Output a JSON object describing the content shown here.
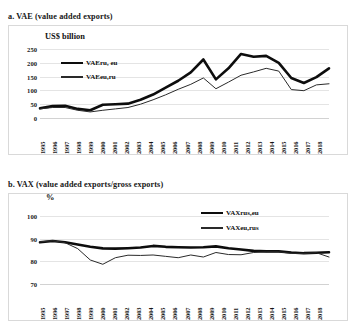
{
  "figure": {
    "panels": [
      {
        "caption": "a. VAE (value added exports)",
        "unit_label": "US$ billion"
      },
      {
        "caption": "b. VAX (value added exports/gross exports)",
        "unit_label": "%"
      }
    ]
  },
  "colors": {
    "series_thick": "#0d0d0d",
    "series_thin": "#2a2a2a",
    "grid": "#e4e4e4",
    "frame": "#d9d9d9",
    "background": "#ffffff"
  },
  "chart_data": [
    {
      "type": "line",
      "title": "a. VAE (value added exports)",
      "xlabel": "",
      "ylabel": "US$ billion",
      "ylim": [
        0,
        250
      ],
      "yticks": [
        0,
        50,
        100,
        150,
        200,
        250
      ],
      "grid": true,
      "legend_position": "upper-left-inside",
      "x": [
        1995,
        1996,
        1997,
        1998,
        1999,
        2000,
        2001,
        2002,
        2003,
        2004,
        2005,
        2006,
        2007,
        2008,
        2009,
        2010,
        2011,
        2012,
        2013,
        2014,
        2015,
        2016,
        2017,
        2018
      ],
      "categories": [
        "1995",
        "1996",
        "1997",
        "1998",
        "1999",
        "2000",
        "2001",
        "2002",
        "2003",
        "2004",
        "2005",
        "2006",
        "2007",
        "2008",
        "2009",
        "2010",
        "2011",
        "2012",
        "2013",
        "2014",
        "2015",
        "2016",
        "2017",
        "2018"
      ],
      "series": [
        {
          "name": "VAEru, eu",
          "style": "thick",
          "values": [
            35,
            43,
            44,
            33,
            28,
            48,
            50,
            52,
            66,
            85,
            110,
            135,
            165,
            212,
            140,
            180,
            232,
            222,
            225,
            200,
            145,
            127,
            148,
            180
          ]
        },
        {
          "name": "VAEeu,ru",
          "style": "thin",
          "values": [
            33,
            38,
            38,
            28,
            22,
            28,
            33,
            38,
            50,
            66,
            84,
            104,
            122,
            145,
            106,
            130,
            155,
            167,
            180,
            170,
            103,
            99,
            120,
            124
          ]
        }
      ]
    },
    {
      "type": "line",
      "title": "b. VAX (value added exports/gross exports)",
      "xlabel": "",
      "ylabel": "%",
      "ylim": [
        70,
        100
      ],
      "yticks": [
        70,
        80,
        90,
        100
      ],
      "grid": true,
      "legend_position": "upper-right-inside",
      "x": [
        1995,
        1996,
        1997,
        1998,
        1999,
        2000,
        2001,
        2002,
        2003,
        2004,
        2005,
        2006,
        2007,
        2008,
        2009,
        2010,
        2011,
        2012,
        2013,
        2014,
        2015,
        2016,
        2017,
        2018
      ],
      "categories": [
        "1995",
        "1996",
        "1997",
        "1998",
        "1999",
        "2000",
        "2001",
        "2002",
        "2003",
        "2004",
        "2005",
        "2006",
        "2007",
        "2008",
        "2009",
        "2010",
        "2011",
        "2012",
        "2013",
        "2014",
        "2015",
        "2016",
        "2017",
        "2018"
      ],
      "series": [
        {
          "name": "VAXrus,eu",
          "style": "thick",
          "values": [
            88.4,
            89.0,
            88.4,
            87.4,
            86.4,
            85.7,
            85.6,
            85.8,
            86.1,
            86.8,
            86.4,
            86.2,
            86.1,
            86.2,
            86.6,
            85.8,
            85.2,
            84.6,
            84.4,
            84.4,
            83.9,
            83.6,
            83.8,
            84.0
          ]
        },
        {
          "name": "VAXeu,rus",
          "style": "thin",
          "values": [
            88.6,
            89.1,
            88.2,
            85.6,
            80.6,
            78.7,
            81.6,
            82.7,
            82.6,
            82.8,
            82.2,
            81.6,
            82.8,
            81.9,
            83.9,
            83.0,
            82.9,
            83.9,
            84.2,
            84.2,
            83.5,
            83.5,
            83.8,
            81.9
          ]
        }
      ]
    }
  ]
}
